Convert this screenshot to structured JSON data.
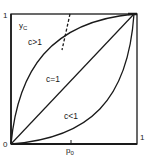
{
  "diagram": {
    "type": "function-curves",
    "axes": {
      "x_label": "p",
      "x_label_sub": "0",
      "y_label": "y",
      "y_label_sub": "C",
      "origin": "0",
      "x_max": "1",
      "y_max": "1"
    },
    "curves": [
      {
        "label": "c>1",
        "shape": "concave"
      },
      {
        "label": "c=1",
        "shape": "diagonal"
      },
      {
        "label": "c<1",
        "shape": "convex"
      }
    ],
    "annotations": {
      "dashed_marker": "dashed line crossing the c>1 curve",
      "p0_tick": "tick on x-axis at p0"
    },
    "colors": {
      "line": "#1a1a1a",
      "background": "#ffffff"
    }
  }
}
